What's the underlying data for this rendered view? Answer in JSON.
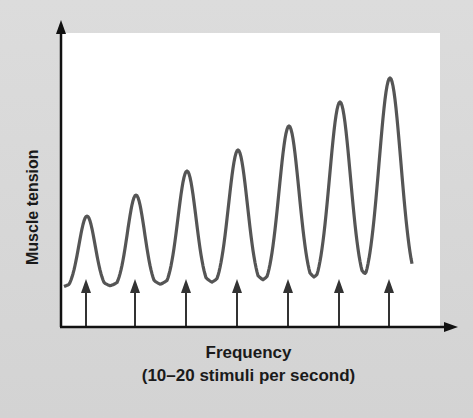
{
  "chart_data": {
    "type": "line",
    "title": "",
    "xlabel": "Frequency",
    "xlabel_sub": "(10–20 stimuli per second)",
    "ylabel": "Muscle tension",
    "grid": false,
    "legend": null,
    "stimuli_count": 7,
    "series": [
      {
        "name": "Muscle tension (summation)",
        "peaks": [
          1,
          2,
          3,
          4,
          5,
          6,
          7
        ],
        "relative_peak_height": [
          0.37,
          0.44,
          0.52,
          0.59,
          0.67,
          0.75,
          0.83
        ],
        "baseline": 0.12,
        "color": "#555555"
      }
    ],
    "annotations": [
      "upward arrows mark each stimulus"
    ]
  },
  "labels": {
    "x": "Frequency",
    "x_sub": "(10–20 stimuli per second)",
    "y": "Muscle tension"
  }
}
